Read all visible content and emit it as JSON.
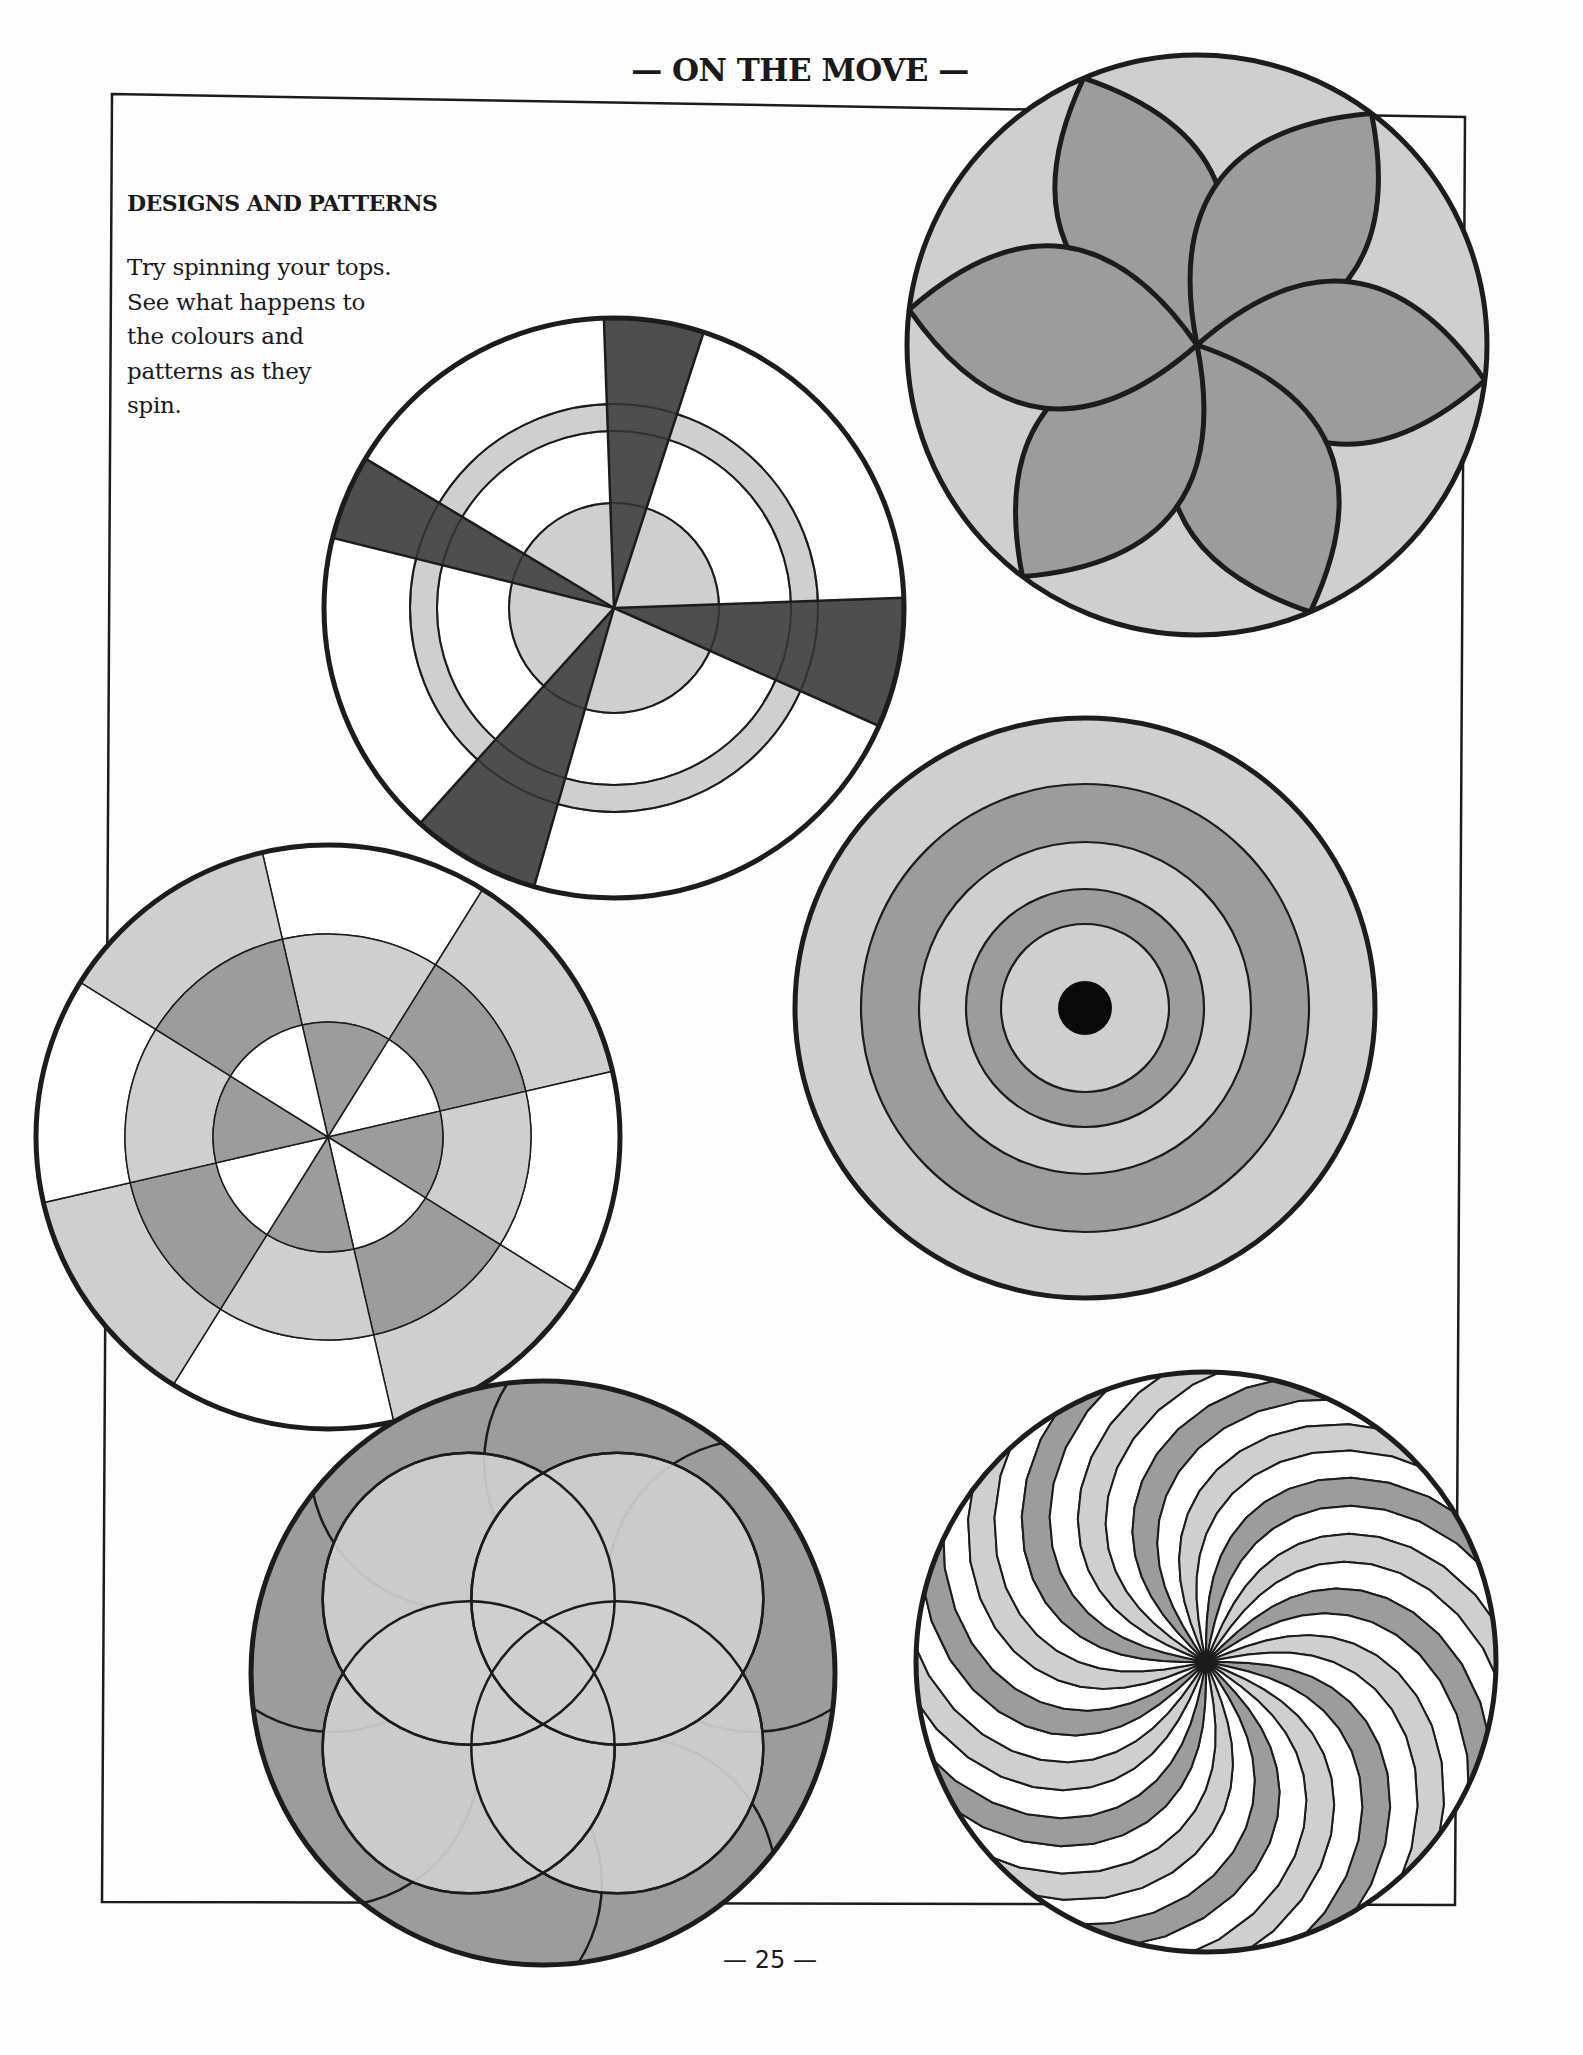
{
  "header": {
    "title": "— ON THE MOVE —"
  },
  "section": {
    "heading": "DESIGNS AND PATTERNS",
    "body_lines": [
      "Try spinning your tops.",
      "See what happens to",
      "the colours and",
      "patterns as they",
      "spin."
    ]
  },
  "footer": {
    "page_number": "— 25 —"
  },
  "colors": {
    "outline": "#1c1c1c",
    "white": "#ffffff",
    "light_grey": "#cfcfcf",
    "mid_grey": "#9c9c9c",
    "dark_grey": "#4e4e4e",
    "black": "#0a0a0a",
    "paper": "#fdfdfd"
  },
  "frame": {
    "points": [
      [
        112,
        94
      ],
      [
        1465,
        117
      ],
      [
        1455,
        1905
      ],
      [
        102,
        1902
      ]
    ]
  },
  "designs": [
    {
      "name": "flower-petal-top",
      "type": "petals",
      "cx": 1197,
      "cy": 345,
      "r": 290,
      "count": 6,
      "start_angle": -113,
      "petal_width": 0.28
    },
    {
      "name": "sector-ring-top",
      "type": "sectors-rings",
      "cx": 614,
      "cy": 608,
      "r": 290,
      "disc_r": 105,
      "ring_inner": 177,
      "ring_outer": 204,
      "dark_wedges": [
        [
          -92,
          -72
        ],
        [
          -166,
          -149
        ],
        [
          -2,
          24
        ],
        [
          106,
          132
        ]
      ]
    },
    {
      "name": "segmented-ring-top",
      "type": "segmented",
      "cx": 328,
      "cy": 1137,
      "r": 292,
      "inner_r": 115,
      "mid_r": 203,
      "sector_count": 8,
      "start_angle": -103
    },
    {
      "name": "concentric-target-top",
      "type": "concentric",
      "cx": 1085,
      "cy": 1008,
      "r": 290,
      "rings": [
        224,
        166,
        119,
        84
      ],
      "dot_r": 27
    },
    {
      "name": "overlapping-circles-top",
      "type": "overlap",
      "cx": 543,
      "cy": 1673,
      "r": 292
    },
    {
      "name": "spiral-top",
      "type": "spiral",
      "cx": 1206,
      "cy": 1662,
      "r": 290,
      "arms": 32,
      "twist": 62
    }
  ]
}
